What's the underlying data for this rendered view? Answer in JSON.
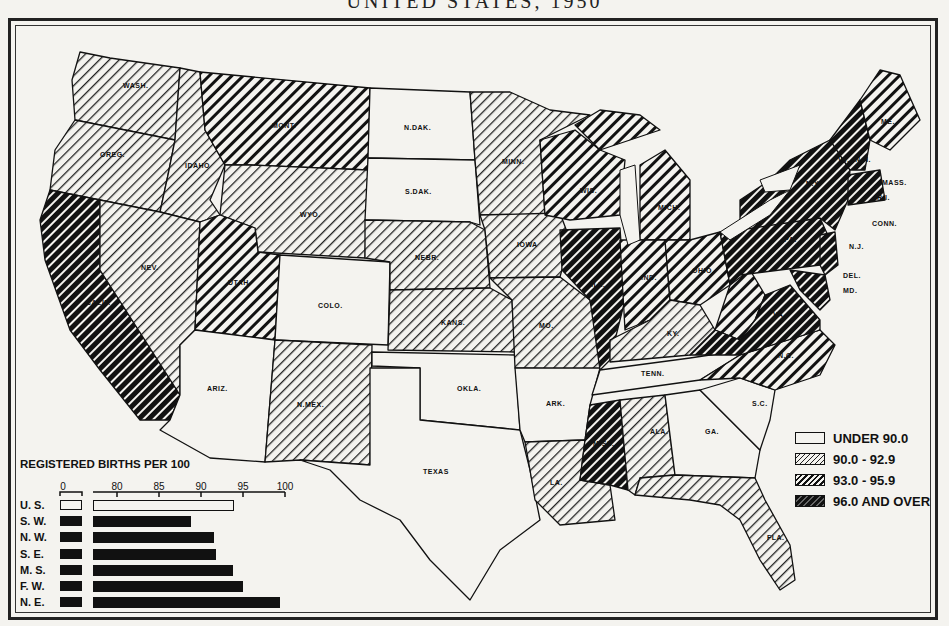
{
  "title": "UNITED STATES, 1950",
  "legend": {
    "items": [
      {
        "label": "UNDER 90.0",
        "pattern": "none"
      },
      {
        "label": "90.0 - 92.9",
        "pattern": "light-hatch"
      },
      {
        "label": "93.0 - 95.9",
        "pattern": "medium-hatch"
      },
      {
        "label": "96.0 AND OVER",
        "pattern": "dark-hatch"
      }
    ]
  },
  "states": {
    "WASH": "WASH.",
    "OREG": "OREG.",
    "CALIF": "CALIF.",
    "IDAHO": "IDAHO",
    "NEV": "NEV.",
    "MONT": "MONT.",
    "WYO": "WYO.",
    "UTAH": "UTAH",
    "ARIZ": "ARIZ.",
    "COLO": "COLO.",
    "NMEX": "N.MEX.",
    "NDAK": "N.DAK.",
    "SDAK": "S.DAK.",
    "NEBR": "NEBR.",
    "KANS": "KANS.",
    "OKLA": "OKLA.",
    "TEXAS": "TEXAS",
    "MINN": "MINN.",
    "IOWA": "IOWA",
    "MO": "MO.",
    "ARK": "ARK.",
    "LA": "LA.",
    "WIS": "WIS.",
    "ILL": "ILL.",
    "MICH": "MICH.",
    "IND": "IND.",
    "OHIO": "OHIO",
    "KY": "KY.",
    "TENN": "TENN.",
    "MISS": "MISS.",
    "ALA": "ALA.",
    "GA": "GA.",
    "FLA": "FLA.",
    "SC": "S.C.",
    "NC": "N.C.",
    "VA": "VA.",
    "PA": "PA.",
    "NY": "N.Y.",
    "VT": "VT.",
    "NH": "N.H.",
    "ME": "ME.",
    "MASS": "MASS.",
    "RI": "R.I.",
    "CONN": "CONN.",
    "NJ": "N.J.",
    "DEL": "DEL.",
    "MD": "MD."
  },
  "bar_chart": {
    "title": "REGISTERED BIRTHS PER 100",
    "axis_ticks": [
      "0",
      "80",
      "85",
      "90",
      "95",
      "100"
    ],
    "rows": [
      {
        "label": "U. S.",
        "value": 93.9,
        "style": "open"
      },
      {
        "label": "S. W.",
        "value": 88.8,
        "style": "solid"
      },
      {
        "label": "N. W.",
        "value": 91.5,
        "style": "solid"
      },
      {
        "label": "S. E.",
        "value": 91.8,
        "style": "solid"
      },
      {
        "label": "M. S.",
        "value": 93.8,
        "style": "solid"
      },
      {
        "label": "F. W.",
        "value": 95.0,
        "style": "solid"
      },
      {
        "label": "N. E.",
        "value": 99.4,
        "style": "solid"
      }
    ]
  },
  "chart_data": {
    "type": "bar",
    "title": "REGISTERED BIRTHS PER 100",
    "categories": [
      "U. S.",
      "S. W.",
      "N. W.",
      "S. E.",
      "M. S.",
      "F. W.",
      "N. E."
    ],
    "values": [
      93.9,
      88.8,
      91.5,
      91.8,
      93.8,
      95.0,
      99.4
    ],
    "xlabel": "",
    "ylabel": "",
    "xlim": [
      0,
      100
    ],
    "tick_labels": [
      "0",
      "80",
      "85",
      "90",
      "95",
      "100"
    ],
    "orientation": "horizontal",
    "note": "axis broken between 0 and ~77"
  },
  "map_classes": {
    "under_90": [
      "N.DAK.",
      "S.DAK.",
      "COLO.",
      "ARIZ.",
      "OKLA.",
      "TEXAS",
      "ARK.",
      "TENN.",
      "GA.",
      "S.C."
    ],
    "90_to_92_9": [
      "WASH.",
      "OREG.",
      "IDAHO",
      "NEV.",
      "WYO.",
      "N.MEX.",
      "NEBR.",
      "KANS.",
      "MINN.",
      "IOWA",
      "MO.",
      "KY.",
      "LA.",
      "ALA.",
      "FLA."
    ],
    "93_to_95_9": [
      "MONT.",
      "UTAH",
      "WIS.",
      "MICH.",
      "IND.",
      "OHIO",
      "W.VA.",
      "N.C.",
      "ME."
    ],
    "96_and_over": [
      "CALIF.",
      "ILL.",
      "MISS.",
      "N.Y.",
      "PA.",
      "VT.",
      "N.H.",
      "MASS.",
      "R.I.",
      "CONN.",
      "N.J.",
      "DEL.",
      "MD.",
      "VA."
    ]
  }
}
